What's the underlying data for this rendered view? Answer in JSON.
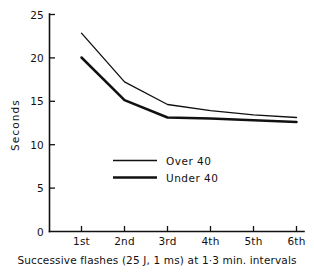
{
  "chart_data": {
    "type": "line",
    "title": "",
    "xlabel": "Successive flashes (25 J, 1 ms) at 1·3 min. intervals",
    "ylabel": "Seconds",
    "categories": [
      "1st",
      "2nd",
      "3rd",
      "4th",
      "5th",
      "6th"
    ],
    "series": [
      {
        "name": "Over 40",
        "values": [
          22.8,
          17.2,
          14.6,
          13.9,
          13.4,
          13.1
        ],
        "line_style": "thin"
      },
      {
        "name": "Under 40",
        "values": [
          20.0,
          15.1,
          13.1,
          13.0,
          12.8,
          12.6
        ],
        "line_style": "thick"
      }
    ],
    "ylim": [
      0,
      25
    ],
    "yticks": [
      0,
      5,
      10,
      15,
      20,
      25
    ],
    "ytick_labels": [
      "0",
      "5",
      "10",
      "15",
      "20",
      "25"
    ],
    "grid": false,
    "legend_position": "center-left-inside"
  },
  "axes": {
    "y_axis_title": "Seconds",
    "y_tick_labels": [
      "25",
      "20",
      "15",
      "10",
      "5",
      "0"
    ],
    "x_tick_labels": [
      "1st",
      "2nd",
      "3rd",
      "4th",
      "5th",
      "6th"
    ],
    "x_caption": "Successive flashes (25 J, 1 ms) at 1·3 min. intervals"
  },
  "legend": {
    "entries": [
      {
        "label": "Over 40"
      },
      {
        "label": "Under 40"
      }
    ]
  },
  "style": {
    "ink": "#111111",
    "background": "#ffffff"
  }
}
